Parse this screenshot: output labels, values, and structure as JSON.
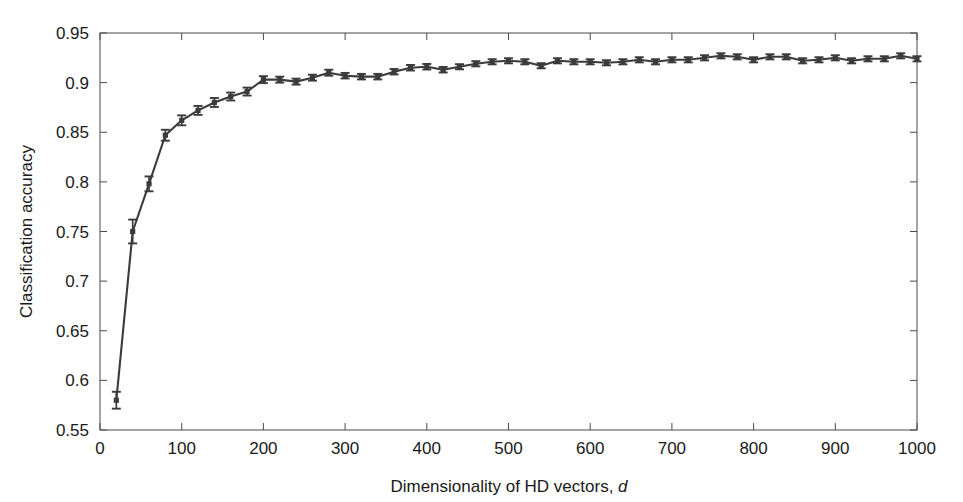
{
  "chart_data": {
    "type": "line",
    "title": "",
    "subtitle": "",
    "xlabel_prefix": "Dimensionality of HD vectors,",
    "xlabel_italic": "d",
    "xlabel": "Dimensionality of HD vectors, d",
    "ylabel": "Classification accuracy",
    "xlim": [
      0,
      1000
    ],
    "ylim": [
      0.55,
      0.95
    ],
    "xticks": [
      0,
      100,
      200,
      300,
      400,
      500,
      600,
      700,
      800,
      900,
      1000
    ],
    "xtick_labels": [
      "0",
      "100",
      "200",
      "300",
      "400",
      "500",
      "600",
      "700",
      "800",
      "900",
      "1000"
    ],
    "yticks": [
      0.55,
      0.6,
      0.65,
      0.7,
      0.75,
      0.8,
      0.85,
      0.9,
      0.95
    ],
    "ytick_labels": [
      "0.55",
      "0.6",
      "0.65",
      "0.7",
      "0.75",
      "0.8",
      "0.85",
      "0.9",
      "0.95"
    ],
    "grid": false,
    "legend": false,
    "legend_position": "none",
    "marker": "square",
    "error_bars": true,
    "line_color": "#3b3b3b",
    "marker_color": "#3b3b3b",
    "axis_color": "#4a4a4a",
    "background_color": "#ffffff",
    "x": [
      20,
      40,
      60,
      80,
      100,
      120,
      140,
      160,
      180,
      200,
      220,
      240,
      260,
      280,
      300,
      320,
      340,
      360,
      380,
      400,
      420,
      440,
      460,
      480,
      500,
      520,
      540,
      560,
      580,
      600,
      620,
      640,
      660,
      680,
      700,
      720,
      740,
      760,
      780,
      800,
      820,
      840,
      860,
      880,
      900,
      920,
      940,
      960,
      980,
      1000
    ],
    "values": [
      0.58,
      0.75,
      0.798,
      0.847,
      0.862,
      0.872,
      0.88,
      0.886,
      0.891,
      0.903,
      0.903,
      0.901,
      0.905,
      0.91,
      0.907,
      0.906,
      0.906,
      0.911,
      0.915,
      0.916,
      0.913,
      0.916,
      0.919,
      0.921,
      0.922,
      0.921,
      0.917,
      0.922,
      0.921,
      0.921,
      0.92,
      0.921,
      0.923,
      0.921,
      0.923,
      0.923,
      0.925,
      0.927,
      0.926,
      0.923,
      0.926,
      0.926,
      0.922,
      0.923,
      0.925,
      0.922,
      0.924,
      0.924,
      0.927,
      0.924
    ],
    "errors": [
      0.0085,
      0.012,
      0.0075,
      0.0055,
      0.005,
      0.0045,
      0.0045,
      0.004,
      0.004,
      0.0035,
      0.003,
      0.003,
      0.003,
      0.003,
      0.0028,
      0.0028,
      0.0028,
      0.0028,
      0.0028,
      0.0028,
      0.0028,
      0.0026,
      0.0026,
      0.0026,
      0.0026,
      0.0026,
      0.0026,
      0.0026,
      0.0026,
      0.0026,
      0.0026,
      0.0026,
      0.0026,
      0.0026,
      0.0026,
      0.0026,
      0.0026,
      0.0026,
      0.0026,
      0.0026,
      0.0026,
      0.0026,
      0.0026,
      0.0026,
      0.0026,
      0.0026,
      0.0026,
      0.0026,
      0.0026,
      0.0026
    ],
    "series": [
      {
        "name": "Classification accuracy",
        "values": [
          0.58,
          0.75,
          0.798,
          0.847,
          0.862,
          0.872,
          0.88,
          0.886,
          0.891,
          0.903,
          0.903,
          0.901,
          0.905,
          0.91,
          0.907,
          0.906,
          0.906,
          0.911,
          0.915,
          0.916,
          0.913,
          0.916,
          0.919,
          0.921,
          0.922,
          0.921,
          0.917,
          0.922,
          0.921,
          0.921,
          0.92,
          0.921,
          0.923,
          0.921,
          0.923,
          0.923,
          0.925,
          0.927,
          0.926,
          0.923,
          0.926,
          0.926,
          0.922,
          0.923,
          0.925,
          0.922,
          0.924,
          0.924,
          0.927,
          0.924
        ]
      }
    ]
  }
}
